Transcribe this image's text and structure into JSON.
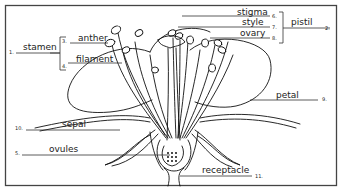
{
  "diagram": {
    "type": "labeled flower anatomy diagram",
    "labels": {
      "stamen": {
        "num": "1.",
        "text": "stamen"
      },
      "pistil": {
        "num": "2.",
        "text": "pistil"
      },
      "anther": {
        "num": "3.",
        "text": "anther"
      },
      "filament": {
        "num": "4.",
        "text": "filament"
      },
      "ovules": {
        "num": "5.",
        "text": "ovules"
      },
      "stigma": {
        "num": "6.",
        "text": "stigma"
      },
      "style": {
        "num": "7.",
        "text": "style"
      },
      "ovary": {
        "num": "8.",
        "text": "ovary"
      },
      "petal": {
        "num": "9.",
        "text": "petal"
      },
      "sepal": {
        "num": "10.",
        "text": "sepal"
      },
      "receptacle": {
        "num": "11.",
        "text": "receptacle"
      }
    },
    "colors": {
      "line": "#111111",
      "background": "#ffffff",
      "frame": "#333333"
    }
  }
}
